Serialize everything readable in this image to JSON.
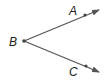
{
  "diagram": {
    "type": "angle",
    "name": "angle ABC",
    "vertex": {
      "label": "B",
      "x": 24,
      "y": 41
    },
    "points": [
      {
        "label": "A",
        "x": 85,
        "y": 15
      },
      {
        "label": "C",
        "x": 86,
        "y": 66
      }
    ],
    "rays": [
      {
        "from": "B",
        "through": "A",
        "end": [
          99,
          10
        ]
      },
      {
        "from": "B",
        "through": "C",
        "end": [
          99,
          72
        ]
      }
    ],
    "stroke_color": "#555555"
  },
  "labels": {
    "A": "A",
    "B": "B",
    "C": "C"
  }
}
